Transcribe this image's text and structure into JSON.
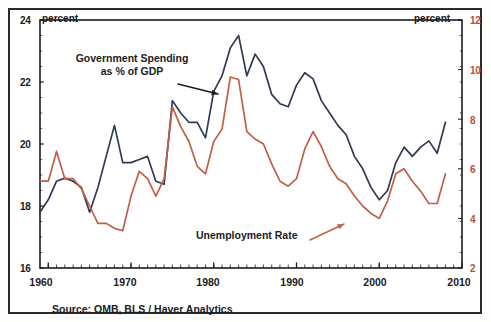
{
  "chart_data": {
    "type": "line",
    "title": "",
    "subtitle": "",
    "xlabel": "",
    "ylabel_left": "percent",
    "ylabel_right": "percent",
    "grid": false,
    "legend_position": "inline-annotations",
    "xlim": [
      1959,
      2010
    ],
    "xticks": [
      1960,
      1970,
      1980,
      1990,
      2000,
      2010
    ],
    "xtick_labels": [
      "1960",
      "1970",
      "1980",
      "1990",
      "2000",
      "2010"
    ],
    "ylim_left": [
      16,
      24
    ],
    "yticks_left": [
      16,
      18,
      20,
      22,
      24
    ],
    "ytick_labels_left": [
      "16",
      "18",
      "20",
      "22",
      "24"
    ],
    "ylim_right": [
      2,
      12
    ],
    "yticks_right": [
      2,
      4,
      6,
      8,
      10,
      12
    ],
    "ytick_labels_right": [
      "2",
      "4",
      "6",
      "8",
      "10",
      "12"
    ],
    "source": "Source: OMB, BLS / Haver Analytics",
    "annotations": [
      {
        "name": "government-spending-annotation",
        "line1": "Government Spending",
        "line2": "as % of GDP",
        "arrow_from": [
          178,
          84
        ],
        "arrow_to": [
          218,
          94
        ]
      },
      {
        "name": "unemployment-rate-annotation",
        "line1": "Unemployment Rate",
        "line2": "",
        "arrow_from": [
          310,
          240
        ],
        "arrow_to": [
          344,
          224
        ]
      }
    ],
    "series": [
      {
        "name": "Government Spending as % of GDP",
        "axis": "left",
        "color": "#2f3b52",
        "x": [
          1959,
          1960,
          1961,
          1962,
          1963,
          1964,
          1965,
          1966,
          1967,
          1968,
          1969,
          1970,
          1971,
          1972,
          1973,
          1974,
          1975,
          1976,
          1977,
          1978,
          1979,
          1980,
          1981,
          1982,
          1983,
          1984,
          1985,
          1986,
          1987,
          1988,
          1989,
          1990,
          1991,
          1992,
          1993,
          1994,
          1995,
          1996,
          1997,
          1998,
          1999,
          2000,
          2001,
          2002,
          2003,
          2004,
          2005,
          2006,
          2007,
          2008
        ],
        "values": [
          17.8,
          18.2,
          18.8,
          18.9,
          18.8,
          18.6,
          17.8,
          18.6,
          19.6,
          20.6,
          19.4,
          19.4,
          19.5,
          19.6,
          18.8,
          18.7,
          21.4,
          21.0,
          20.7,
          20.7,
          20.2,
          21.7,
          22.2,
          23.1,
          23.5,
          22.2,
          22.9,
          22.5,
          21.6,
          21.3,
          21.2,
          21.9,
          22.3,
          22.1,
          21.4,
          21.0,
          20.6,
          20.3,
          19.6,
          19.2,
          18.6,
          18.2,
          18.5,
          19.4,
          19.9,
          19.6,
          19.9,
          20.1,
          19.7,
          20.7
        ],
        "values_at_ticks": {
          "1960": 18.2,
          "1970": 19.4,
          "1980": 21.7,
          "1990": 21.9,
          "2000": 18.2,
          "2008": 20.7
        }
      },
      {
        "name": "Unemployment Rate",
        "axis": "right",
        "color": "#c0604a",
        "x": [
          1959,
          1960,
          1961,
          1962,
          1963,
          1964,
          1965,
          1966,
          1967,
          1968,
          1969,
          1970,
          1971,
          1972,
          1973,
          1974,
          1975,
          1976,
          1977,
          1978,
          1979,
          1980,
          1981,
          1982,
          1983,
          1984,
          1985,
          1986,
          1987,
          1988,
          1989,
          1990,
          1991,
          1992,
          1993,
          1994,
          1995,
          1996,
          1997,
          1998,
          1999,
          2000,
          2001,
          2002,
          2003,
          2004,
          2005,
          2006,
          2007,
          2008
        ],
        "values": [
          5.5,
          5.5,
          6.7,
          5.6,
          5.6,
          5.2,
          4.5,
          3.8,
          3.8,
          3.6,
          3.5,
          4.9,
          5.9,
          5.6,
          4.9,
          5.6,
          8.5,
          7.7,
          7.1,
          6.1,
          5.8,
          7.1,
          7.6,
          9.7,
          9.6,
          7.5,
          7.2,
          7.0,
          6.2,
          5.5,
          5.3,
          5.6,
          6.8,
          7.5,
          6.9,
          6.1,
          5.6,
          5.4,
          4.9,
          4.5,
          4.2,
          4.0,
          4.7,
          5.8,
          6.0,
          5.5,
          5.1,
          4.6,
          4.6,
          5.8
        ],
        "values_at_ticks": {
          "1960": 5.5,
          "1970": 4.9,
          "1980": 7.1,
          "1990": 5.6,
          "2000": 4.0,
          "2008": 5.8
        }
      }
    ]
  },
  "axis": {
    "left_header": "percent",
    "right_header": "percent",
    "left_ticks": [
      "24",
      "22",
      "20",
      "18",
      "16"
    ],
    "right_ticks": [
      "12",
      "10",
      "8",
      "6",
      "4",
      "2"
    ],
    "x_ticks": [
      "1960",
      "1970",
      "1980",
      "1990",
      "2000",
      "2010"
    ]
  },
  "annotations": {
    "spending_line1": "Government Spending",
    "spending_line2": "as % of GDP",
    "unemployment_label": "Unemployment Rate"
  },
  "footer": {
    "source": "Source: OMB, BLS / Haver Analytics"
  },
  "colors": {
    "spending": "#2f3b52",
    "unemployment": "#c0604a",
    "axis": "#1b1b24",
    "background": "#ffffff"
  }
}
